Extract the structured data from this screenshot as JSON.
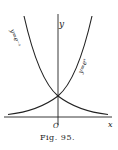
{
  "figure": {
    "caption": "Fig. 95.",
    "axes": {
      "x_label": "x",
      "y_label": "y",
      "origin_label": "O"
    },
    "curves": [
      {
        "name": "exp-neg",
        "label": "y=e⁻ˣ"
      },
      {
        "name": "exp-pos",
        "label": "y=eˣ"
      }
    ]
  }
}
